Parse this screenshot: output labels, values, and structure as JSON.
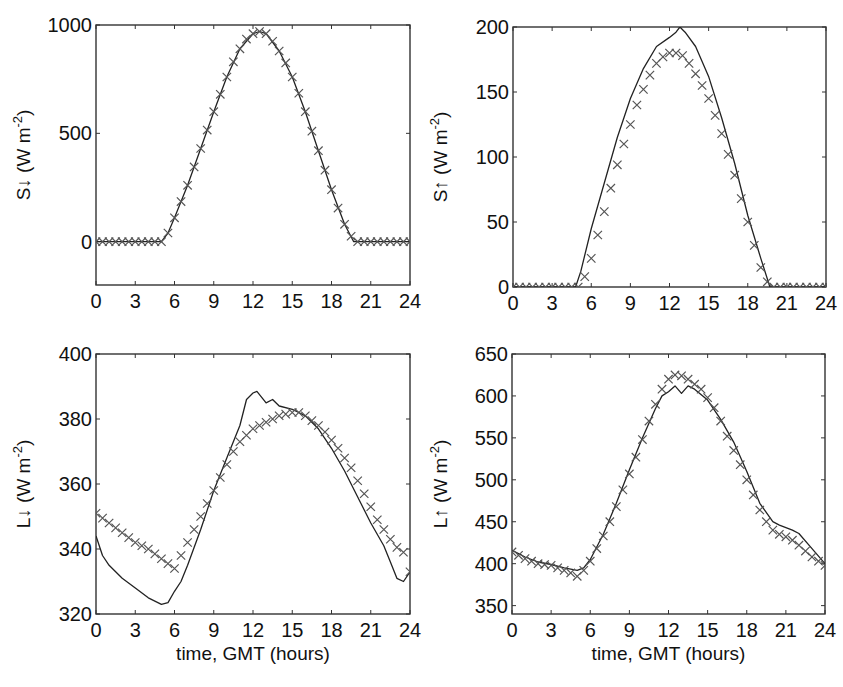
{
  "figure": {
    "background": "#ffffff",
    "line_color": "#222222",
    "marker_color": "#555555",
    "axis_color": "#333333"
  },
  "chart_data": [
    {
      "id": "s-down",
      "type": "line",
      "title": "",
      "xlabel": "",
      "ylabel": "S↓ (W m⁻²)",
      "ylabel_main": "S↓ (W m",
      "ylabel_sup": "-2",
      "ylabel_close": ")",
      "xlim": [
        0,
        24
      ],
      "ylim": [
        -200,
        1000
      ],
      "xticks": [
        0,
        3,
        6,
        9,
        12,
        15,
        18,
        21,
        24
      ],
      "xtick_labels": [
        "0",
        "3",
        "6",
        "9",
        "12",
        "15",
        "18",
        "21",
        "24"
      ],
      "yticks": [
        0,
        500,
        1000
      ],
      "ytick_labels": [
        "0",
        "500",
        "1000"
      ],
      "grid": false,
      "legend": null,
      "box": {
        "left": 96,
        "top": 25,
        "right": 410,
        "bottom": 285
      },
      "series": [
        {
          "name": "model",
          "style": "line",
          "x": [
            0,
            5,
            5.5,
            6,
            7,
            8,
            9,
            10,
            11,
            12,
            12.5,
            13,
            14,
            15,
            16,
            17,
            18,
            19,
            19.7,
            20,
            24
          ],
          "y": [
            0,
            0,
            40,
            110,
            260,
            430,
            600,
            760,
            890,
            960,
            970,
            960,
            880,
            760,
            600,
            420,
            240,
            80,
            0,
            0,
            0
          ]
        },
        {
          "name": "observed",
          "style": "x",
          "x": [
            0,
            0.5,
            1,
            1.5,
            2,
            2.5,
            3,
            3.5,
            4,
            4.5,
            5,
            5.5,
            6,
            6.5,
            7,
            7.5,
            8,
            8.5,
            9,
            9.5,
            10,
            10.5,
            11,
            11.5,
            12,
            12.5,
            13,
            13.5,
            14,
            14.5,
            15,
            15.5,
            16,
            16.5,
            17,
            17.5,
            18,
            18.5,
            19,
            19.5,
            20,
            20.5,
            21,
            21.5,
            22,
            22.5,
            23,
            23.5,
            24
          ],
          "y": [
            0,
            0,
            0,
            0,
            0,
            0,
            0,
            0,
            0,
            0,
            0,
            40,
            110,
            185,
            260,
            345,
            430,
            515,
            600,
            680,
            760,
            830,
            890,
            935,
            960,
            970,
            960,
            925,
            880,
            825,
            760,
            685,
            600,
            510,
            420,
            330,
            240,
            155,
            80,
            25,
            0,
            0,
            0,
            0,
            0,
            0,
            0,
            0,
            0
          ]
        }
      ]
    },
    {
      "id": "s-up",
      "type": "line",
      "title": "",
      "xlabel": "",
      "ylabel": "S↑ (W m⁻²)",
      "ylabel_main": "S↑ (W m",
      "ylabel_sup": "-2",
      "ylabel_close": ")",
      "xlim": [
        0,
        24
      ],
      "ylim": [
        0,
        200
      ],
      "xticks": [
        0,
        3,
        6,
        9,
        12,
        15,
        18,
        21,
        24
      ],
      "xtick_labels": [
        "0",
        "3",
        "6",
        "9",
        "12",
        "15",
        "18",
        "21",
        "24"
      ],
      "yticks": [
        0,
        50,
        100,
        150,
        200
      ],
      "ytick_labels": [
        "0",
        "50",
        "100",
        "150",
        "200"
      ],
      "grid": false,
      "legend": null,
      "box": {
        "left": 513,
        "top": 27,
        "right": 826,
        "bottom": 287
      },
      "series": [
        {
          "name": "model",
          "style": "line",
          "x": [
            0,
            4.8,
            5.2,
            6,
            7,
            8,
            9,
            10,
            11,
            12,
            12.5,
            12.8,
            13.2,
            14,
            15,
            16,
            17,
            18,
            19,
            19.7,
            20,
            24
          ],
          "y": [
            0,
            0,
            12,
            45,
            80,
            115,
            145,
            168,
            185,
            192,
            196,
            200,
            196,
            185,
            162,
            130,
            95,
            55,
            22,
            0,
            0,
            0
          ]
        },
        {
          "name": "observed",
          "style": "x",
          "x": [
            0,
            0.5,
            1,
            1.5,
            2,
            2.5,
            3,
            3.5,
            4,
            4.5,
            5,
            5.5,
            6,
            6.5,
            7,
            7.5,
            8,
            8.5,
            9,
            9.5,
            10,
            10.5,
            11,
            11.5,
            12,
            12.5,
            13,
            13.5,
            14,
            14.5,
            15,
            15.5,
            16,
            16.5,
            17,
            17.5,
            18,
            18.5,
            19,
            19.5,
            20,
            20.5,
            21,
            21.5,
            22,
            22.5,
            23,
            23.5,
            24
          ],
          "y": [
            0,
            0,
            0,
            0,
            0,
            0,
            0,
            0,
            0,
            0,
            0,
            8,
            22,
            40,
            58,
            76,
            94,
            110,
            125,
            140,
            152,
            163,
            172,
            177,
            180,
            180,
            178,
            172,
            164,
            155,
            145,
            132,
            118,
            102,
            86,
            68,
            50,
            32,
            15,
            4,
            0,
            0,
            0,
            0,
            0,
            0,
            0,
            0,
            0
          ]
        }
      ]
    },
    {
      "id": "l-down",
      "type": "line",
      "title": "",
      "xlabel": "time, GMT (hours)",
      "ylabel": "L↓ (W m⁻²)",
      "ylabel_main": "L↓ (W m",
      "ylabel_sup": "-2",
      "ylabel_close": ")",
      "xlim": [
        0,
        24
      ],
      "ylim": [
        320,
        400
      ],
      "xticks": [
        0,
        3,
        6,
        9,
        12,
        15,
        18,
        21,
        24
      ],
      "xtick_labels": [
        "0",
        "3",
        "6",
        "9",
        "12",
        "15",
        "18",
        "21",
        "24"
      ],
      "yticks": [
        320,
        340,
        360,
        380,
        400
      ],
      "ytick_labels": [
        "320",
        "340",
        "360",
        "380",
        "400"
      ],
      "grid": false,
      "legend": null,
      "box": {
        "left": 96,
        "top": 354,
        "right": 410,
        "bottom": 614
      },
      "series": [
        {
          "name": "model",
          "style": "line",
          "x": [
            0,
            0.5,
            1,
            2,
            3,
            4,
            5,
            5.5,
            6,
            6.5,
            7,
            8,
            9,
            10,
            11,
            11.5,
            12,
            12.3,
            12.6,
            13,
            13.5,
            14,
            15,
            15.5,
            16,
            17,
            18,
            19,
            20,
            21,
            22,
            22.5,
            23,
            23.5,
            24
          ],
          "y": [
            344,
            338,
            335,
            331,
            328,
            325,
            323,
            323.5,
            327,
            330,
            335,
            346,
            358,
            368,
            378,
            386,
            388,
            388.5,
            387,
            385,
            386,
            384,
            383,
            382,
            381,
            377,
            371,
            364,
            356,
            348,
            341,
            336,
            331,
            330,
            333
          ]
        },
        {
          "name": "observed",
          "style": "x",
          "x": [
            0,
            0.5,
            1,
            1.5,
            2,
            2.5,
            3,
            3.5,
            4,
            4.5,
            5,
            5.5,
            6,
            6.5,
            7,
            7.5,
            8,
            8.5,
            9,
            9.5,
            10,
            10.5,
            11,
            11.5,
            12,
            12.5,
            13,
            13.5,
            14,
            14.5,
            15,
            15.5,
            16,
            16.5,
            17,
            17.5,
            18,
            18.5,
            19,
            19.5,
            20,
            20.5,
            21,
            21.5,
            22,
            22.5,
            23,
            23.5,
            24
          ],
          "y": [
            351,
            349.5,
            348,
            346.5,
            345,
            343.5,
            342,
            341,
            340,
            338.5,
            337,
            335.5,
            334,
            338,
            342,
            346,
            350,
            354,
            358,
            362,
            366,
            370,
            373,
            375,
            377,
            378,
            379,
            380,
            381,
            381.5,
            382,
            382,
            381,
            379.5,
            378,
            376,
            373.5,
            371,
            368,
            365,
            361,
            357,
            353,
            349,
            346,
            343,
            340.5,
            339,
            333
          ]
        }
      ]
    },
    {
      "id": "l-up",
      "type": "line",
      "title": "",
      "xlabel": "time, GMT (hours)",
      "ylabel": "L↑ (W m⁻²)",
      "ylabel_main": "L↑ (W m",
      "ylabel_sup": "-2",
      "ylabel_close": ")",
      "xlim": [
        0,
        24
      ],
      "ylim": [
        340,
        650
      ],
      "xticks": [
        0,
        3,
        6,
        9,
        12,
        15,
        18,
        21,
        24
      ],
      "xtick_labels": [
        "0",
        "3",
        "6",
        "9",
        "12",
        "15",
        "18",
        "21",
        "24"
      ],
      "yticks": [
        350,
        400,
        450,
        500,
        550,
        600,
        650
      ],
      "ytick_labels": [
        "350",
        "400",
        "450",
        "500",
        "550",
        "600",
        "650"
      ],
      "grid": false,
      "legend": null,
      "box": {
        "left": 512,
        "top": 354,
        "right": 825,
        "bottom": 614
      },
      "series": [
        {
          "name": "model",
          "style": "line",
          "x": [
            0,
            0.5,
            1,
            2,
            3,
            4,
            5,
            5.5,
            6,
            7,
            8,
            9,
            10,
            11,
            11.5,
            12,
            12.5,
            13,
            13.5,
            14,
            15,
            16,
            17,
            18,
            19,
            20,
            20.5,
            21,
            21.5,
            22,
            23,
            24
          ],
          "y": [
            416,
            412,
            408,
            402,
            399,
            395,
            392,
            395,
            405,
            435,
            472,
            512,
            550,
            585,
            600,
            605,
            612,
            603,
            612,
            608,
            595,
            572,
            545,
            510,
            472,
            450,
            446,
            443,
            440,
            436,
            418,
            400
          ]
        },
        {
          "name": "observed",
          "style": "x",
          "x": [
            0,
            0.5,
            1,
            1.5,
            2,
            2.5,
            3,
            3.5,
            4,
            4.5,
            5,
            5.5,
            6,
            6.5,
            7,
            7.5,
            8,
            8.5,
            9,
            9.5,
            10,
            10.5,
            11,
            11.5,
            12,
            12.5,
            13,
            13.5,
            14,
            14.5,
            15,
            15.5,
            16,
            16.5,
            17,
            17.5,
            18,
            18.5,
            19,
            19.5,
            20,
            20.5,
            21,
            21.5,
            22,
            22.5,
            23,
            23.5,
            24
          ],
          "y": [
            414,
            410,
            406,
            403,
            400,
            399,
            398,
            395,
            392,
            389,
            385,
            392,
            403,
            418,
            433,
            450,
            468,
            488,
            507,
            527,
            548,
            570,
            590,
            608,
            620,
            625,
            624,
            620,
            614,
            608,
            598,
            586,
            570,
            552,
            535,
            518,
            500,
            482,
            464,
            450,
            440,
            435,
            432,
            428,
            422,
            415,
            408,
            403,
            398
          ]
        }
      ]
    }
  ]
}
